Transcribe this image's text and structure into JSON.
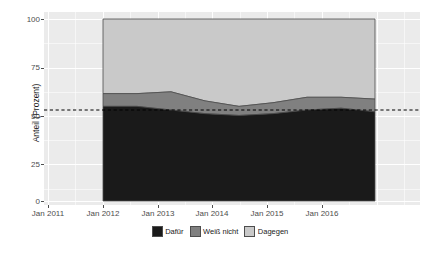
{
  "chart_data": {
    "type": "area",
    "title": "",
    "subtitle": "",
    "xlabel": "",
    "ylabel": "Anteil (Prozent)",
    "stacked": true,
    "stack_total": 100,
    "grid": true,
    "legend_position": "bottom",
    "ylim": [
      0,
      100
    ],
    "yticks": [
      0,
      25,
      50,
      75,
      100
    ],
    "ytick_labels": [
      "0",
      "25",
      "50",
      "75",
      "100"
    ],
    "xlim": [
      "Jan 2011",
      "Jan 2016"
    ],
    "xticks": [
      "Jan 2011",
      "Jan 2012",
      "Jan 2013",
      "Jan 2014",
      "Jan 2015",
      "Jan 2016"
    ],
    "xtick_labels": [
      "Jan 2011",
      "Jan 2012",
      "Jan 2013",
      "Jan 2014",
      "Jan 2015",
      "Jan 2016"
    ],
    "data_x_range": [
      "Jan 2012",
      "Okt 2015"
    ],
    "annotations": [
      {
        "name": "reference-line",
        "type": "hline",
        "value": 50,
        "style": "dashed",
        "color": "#000000"
      }
    ],
    "x": [
      "Jan 2012",
      "Jul 2012",
      "Jan 2013",
      "Jul 2013",
      "Jan 2014",
      "Jul 2014",
      "Jan 2015",
      "Jul 2015",
      "Okt 2015"
    ],
    "series": [
      {
        "name": "Dafür",
        "color": "#1a1a1a",
        "values": [
          52,
          52,
          50,
          48,
          47,
          48,
          50,
          51,
          49
        ]
      },
      {
        "name": "Weiß nicht",
        "color": "#808080",
        "values": [
          7,
          7,
          10,
          7,
          5,
          6,
          7,
          6,
          7
        ]
      },
      {
        "name": "Dagegen",
        "color": "#c9c9c9",
        "values": [
          41,
          41,
          40,
          45,
          48,
          46,
          43,
          43,
          44
        ]
      }
    ],
    "cumulative_top_dafuer": [
      52,
      52,
      50,
      48,
      47,
      48,
      50,
      51,
      49
    ],
    "cumulative_top_weiss_nicht": [
      59,
      59,
      60,
      55,
      52,
      54,
      57,
      57,
      56
    ]
  },
  "legend": {
    "items": [
      {
        "label": "Dafür",
        "color": "#1a1a1a"
      },
      {
        "label": "Weiß nicht",
        "color": "#808080"
      },
      {
        "label": "Dagegen",
        "color": "#c9c9c9"
      }
    ]
  },
  "axes": {
    "y_title": "Anteil (Prozent)",
    "y_labels": [
      "100",
      "75",
      "50",
      "25",
      "0"
    ],
    "x_labels": [
      "Jan 2011",
      "Jan 2012",
      "Jan 2013",
      "Jan 2014",
      "Jan 2015",
      "Jan 2016"
    ]
  },
  "colors": {
    "panel_background": "#ebebeb",
    "grid": "#ffffff",
    "axis_text": "#4d4d4d",
    "series_dafuer": "#1a1a1a",
    "series_weiss_nicht": "#808080",
    "series_dagegen": "#c9c9c9",
    "area_outline": "#4d4d4d",
    "reference_line": "#000000"
  }
}
